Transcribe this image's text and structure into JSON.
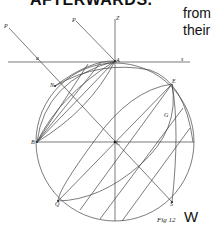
{
  "page": {
    "heading_fragment": "AFTERWARDS.",
    "side_text": [
      "from",
      "their",
      "W"
    ]
  },
  "figure": {
    "caption": "Fig 12",
    "labels": {
      "P1": "P",
      "P2": "P",
      "Z": "Z",
      "a": "a",
      "A": "A",
      "s": "s",
      "N": "N",
      "E": "E",
      "G": "G",
      "B": "B",
      "C": "C",
      "Q": "Q",
      "S": "S"
    },
    "colors": {
      "ink": "#444444",
      "text": "#111111",
      "background": "#ffffff"
    }
  }
}
